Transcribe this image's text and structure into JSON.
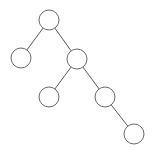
{
  "diagram": {
    "type": "binary-tree",
    "colors": {
      "background": "#ffffff",
      "node_stroke": "#6a6a6a",
      "node_fill": "#ffffff",
      "edge_stroke": "#5a5a5a"
    },
    "node_radius": 10,
    "nodes": [
      {
        "id": "root",
        "label": "",
        "cx": 49,
        "cy": 20
      },
      {
        "id": "left",
        "label": "",
        "cx": 21,
        "cy": 58
      },
      {
        "id": "right",
        "label": "",
        "cx": 77,
        "cy": 59
      },
      {
        "id": "right-left",
        "label": "",
        "cx": 49,
        "cy": 97
      },
      {
        "id": "right-right",
        "label": "",
        "cx": 105,
        "cy": 97
      },
      {
        "id": "right-right-right",
        "label": "",
        "cx": 134,
        "cy": 134
      }
    ],
    "edges": [
      {
        "from": "root",
        "to": "left"
      },
      {
        "from": "root",
        "to": "right"
      },
      {
        "from": "right",
        "to": "right-left"
      },
      {
        "from": "right",
        "to": "right-right"
      },
      {
        "from": "right-right",
        "to": "right-right-right"
      }
    ]
  }
}
